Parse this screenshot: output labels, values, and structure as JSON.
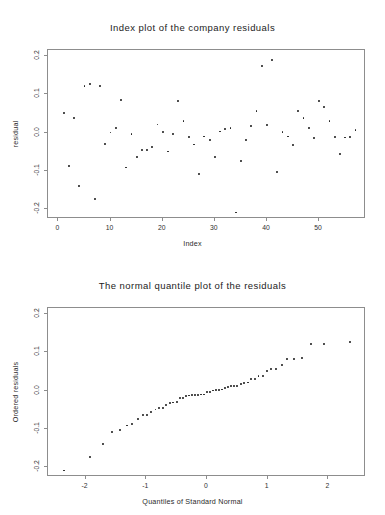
{
  "chart_data": [
    {
      "type": "scatter",
      "id": "index-plot",
      "title": "Index plot of the company residuals",
      "xlabel": "Index",
      "ylabel": "residual",
      "xlim": [
        -2,
        59
      ],
      "ylim": [
        -0.225,
        0.215
      ],
      "grid": false,
      "legend": null,
      "xticks": [
        0,
        10,
        20,
        30,
        40,
        50
      ],
      "xticklabels": [
        "0",
        "10",
        "20",
        "30",
        "40",
        "50"
      ],
      "yticks": [
        0.2,
        0.1,
        0.0,
        -0.1,
        -0.2
      ],
      "yticklabels": [
        "0.2",
        "0.1",
        "0.0",
        "-0.1",
        "-0.2"
      ],
      "x": [
        1,
        2,
        3,
        4,
        5,
        6,
        7,
        8,
        9,
        10,
        11,
        12,
        13,
        14,
        15,
        16,
        17,
        18,
        19,
        20,
        21,
        22,
        23,
        24,
        25,
        26,
        27,
        28,
        29,
        30,
        31,
        32,
        33,
        34,
        35,
        36,
        37,
        38,
        39,
        40,
        41,
        42,
        43,
        44,
        45,
        46,
        47,
        48,
        49,
        50,
        51,
        52,
        53,
        54,
        55,
        56,
        57
      ],
      "y": [
        0.05,
        -0.088,
        0.037,
        -0.14,
        0.121,
        0.127,
        -0.173,
        0.122,
        -0.03,
        0.0,
        0.012,
        0.085,
        -0.091,
        -0.004,
        -0.063,
        -0.046,
        -0.046,
        -0.037,
        0.021,
        0.002,
        -0.049,
        -0.003,
        0.083,
        0.031,
        -0.012,
        -0.031,
        -0.107,
        -0.01,
        -0.02,
        -0.064,
        0.003,
        0.009,
        0.011,
        -0.208,
        -0.074,
        -0.02,
        0.018,
        0.057,
        0.173,
        0.019,
        0.19,
        -0.102,
        0.001,
        -0.01,
        -0.032,
        0.057,
        0.037,
        0.012,
        -0.014,
        0.083,
        0.066,
        0.031,
        -0.011,
        -0.056,
        -0.013,
        -0.011,
        0.006
      ]
    },
    {
      "type": "scatter",
      "id": "normal-qq-plot",
      "title": "The normal quantile plot of the residuals",
      "xlabel": "Quantiles of Standard Normal",
      "ylabel": "Ordered residuals",
      "xlim": [
        -2.62,
        2.62
      ],
      "ylim": [
        -0.225,
        0.215
      ],
      "grid": false,
      "legend": null,
      "xticks": [
        -2,
        -1,
        0,
        1,
        2
      ],
      "xticklabels": [
        "-2",
        "-1",
        "0",
        "1",
        "2"
      ],
      "yticks": [
        0.2,
        0.1,
        0.0,
        -0.1,
        -0.2
      ],
      "yticklabels": [
        "0.2",
        "0.1",
        "0.0",
        "-0.1",
        "-0.2"
      ],
      "x": [
        -2.35,
        -1.93,
        -1.72,
        -1.56,
        -1.43,
        -1.32,
        -1.23,
        -1.14,
        -1.06,
        -0.99,
        -0.92,
        -0.85,
        -0.79,
        -0.73,
        -0.67,
        -0.61,
        -0.56,
        -0.5,
        -0.45,
        -0.4,
        -0.35,
        -0.3,
        -0.25,
        -0.2,
        -0.15,
        -0.1,
        -0.05,
        0.0,
        0.05,
        0.1,
        0.15,
        0.2,
        0.25,
        0.3,
        0.35,
        0.4,
        0.45,
        0.5,
        0.56,
        0.61,
        0.67,
        0.73,
        0.79,
        0.85,
        0.92,
        0.99,
        1.06,
        1.14,
        1.23,
        1.32,
        1.43,
        1.56,
        1.72,
        1.93,
        2.35
      ],
      "y": [
        -0.208,
        -0.173,
        -0.14,
        -0.107,
        -0.102,
        -0.091,
        -0.088,
        -0.074,
        -0.064,
        -0.063,
        -0.056,
        -0.049,
        -0.046,
        -0.046,
        -0.037,
        -0.032,
        -0.031,
        -0.03,
        -0.02,
        -0.02,
        -0.014,
        -0.013,
        -0.012,
        -0.011,
        -0.011,
        -0.01,
        -0.01,
        -0.004,
        -0.003,
        0.0,
        0.001,
        0.002,
        0.003,
        0.006,
        0.009,
        0.011,
        0.012,
        0.012,
        0.018,
        0.019,
        0.021,
        0.031,
        0.031,
        0.037,
        0.037,
        0.05,
        0.057,
        0.057,
        0.066,
        0.083,
        0.083,
        0.085,
        0.121,
        0.122,
        0.127,
        0.173,
        0.19
      ]
    }
  ]
}
